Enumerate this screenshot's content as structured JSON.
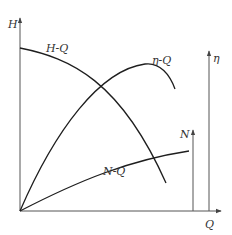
{
  "diagram": {
    "axes": {
      "h_axis": {
        "label": "H"
      },
      "q_axis": {
        "label": "Q"
      },
      "eta_axis": {
        "label": "η"
      },
      "n_axis": {
        "label": "N"
      }
    },
    "curves": {
      "hq": {
        "label": "H-Q"
      },
      "etaq": {
        "label": "η-Q"
      },
      "nq": {
        "label": "N-Q"
      }
    },
    "colors": {
      "curve": "#1e1e1e",
      "axis": "#555555",
      "text": "#333333",
      "background": "#ffffff"
    }
  }
}
